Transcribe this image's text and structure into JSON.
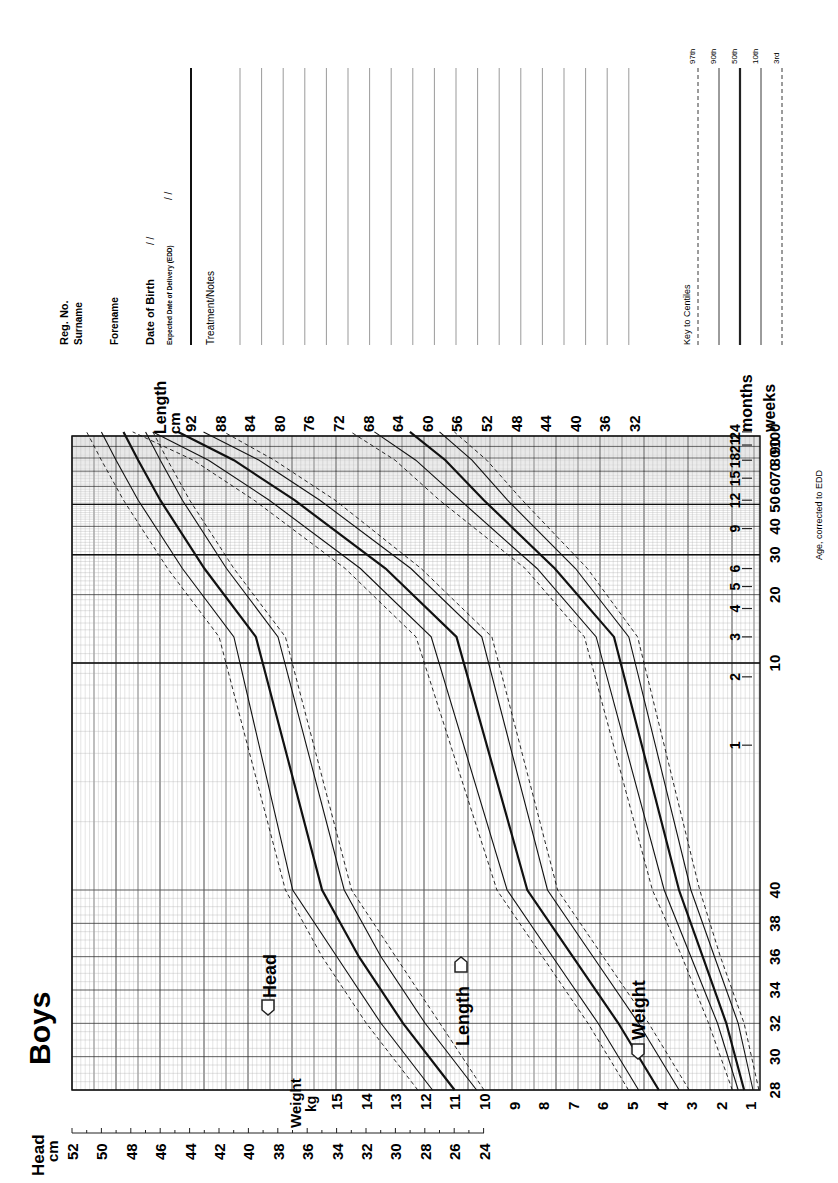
{
  "title": "Boys",
  "form": {
    "reg_no_label": "Reg. No.",
    "surname_label": "Surname",
    "forename_label": "Forename",
    "dob_label": "Date of Birth",
    "dob_value": "/ /",
    "edd_label": "Expected Date of Delivery (EDD)",
    "edd_value": "/ /",
    "notes_label": "Treatment/Notes",
    "notes_line_count": 20
  },
  "key": {
    "title": "Key to Centiles",
    "items": [
      {
        "label": "97th",
        "style": "dashed"
      },
      {
        "label": "90th",
        "style": "solid"
      },
      {
        "label": "50th",
        "style": "bold"
      },
      {
        "label": "10th",
        "style": "solid"
      },
      {
        "label": "3rd",
        "style": "dashed"
      }
    ]
  },
  "axes": {
    "head_title": "Head",
    "head_unit": "cm",
    "head_ticks": [
      52,
      50,
      48,
      46,
      44,
      42,
      40,
      38,
      36,
      34,
      32,
      30,
      28,
      26,
      24
    ],
    "weight_title": "Weight",
    "weight_unit": "kg",
    "weight_ticks": [
      15,
      14,
      13,
      12,
      11,
      10,
      9,
      8,
      7,
      6,
      5,
      4,
      3,
      2,
      1
    ],
    "length_title": "Length",
    "length_unit": "cm",
    "length_ticks": [
      92,
      88,
      84,
      80,
      76,
      72,
      68,
      64,
      60,
      56,
      52,
      48,
      44,
      40,
      36,
      32
    ],
    "weeks_title": "weeks",
    "weeks_ticks": [
      "28",
      "30",
      "32",
      "34",
      "36",
      "38",
      "40",
      "10",
      "20",
      "30",
      "40",
      "50",
      "60",
      "70",
      "80",
      "90",
      "100"
    ],
    "months_title": "months",
    "months_ticks": [
      "1",
      "2",
      "3",
      "4",
      "5",
      "6",
      "9",
      "12",
      "15",
      "18",
      "21",
      "24"
    ],
    "footnote": "Age, corrected to EDD"
  },
  "labels": {
    "head": "Head",
    "length": "Length",
    "weight": "Weight"
  },
  "chart_data": {
    "type": "line",
    "title": "Boys",
    "xlabel": "Age, corrected to EDD (weeks gestation 28-40, then weeks 0-100 / months 1-24)",
    "x_ticks": [
      "28",
      "30",
      "32",
      "34",
      "36",
      "38",
      "40",
      "1m",
      "2m",
      "3m",
      "4m",
      "5m",
      "6m",
      "9m",
      "12m",
      "15m",
      "18m",
      "21m",
      "24m"
    ],
    "x": [
      "28w",
      "32w",
      "36w",
      "40w",
      "3m",
      "6m",
      "12m",
      "18m",
      "24m"
    ],
    "grid": true,
    "legend": [
      "97th",
      "90th",
      "50th",
      "10th",
      "3rd"
    ],
    "series": [
      {
        "name": "Head 97th (cm)",
        "values": [
          28.5,
          32,
          35,
          37.5,
          42,
          45.5,
          48.5,
          50,
          51
        ]
      },
      {
        "name": "Head 90th (cm)",
        "values": [
          27.5,
          31,
          34,
          37,
          41,
          44.5,
          47.5,
          49,
          50
        ]
      },
      {
        "name": "Head 50th (cm)",
        "values": [
          26,
          29.5,
          32.5,
          35,
          39.5,
          43,
          46,
          47.5,
          48.5
        ]
      },
      {
        "name": "Head 10th (cm)",
        "values": [
          24.5,
          28,
          31,
          33.5,
          38,
          41.5,
          44.5,
          46,
          47
        ]
      },
      {
        "name": "Head 3rd (cm)",
        "values": [
          24,
          27,
          30,
          33,
          37.5,
          41,
          44,
          45.5,
          46.5
        ]
      },
      {
        "name": "Length 97th (cm)",
        "values": [
          41,
          45,
          49.5,
          54,
          62,
          69,
          78,
          84,
          90
        ]
      },
      {
        "name": "Length 90th (cm)",
        "values": [
          40,
          44,
          48.5,
          53,
          60.5,
          67.5,
          76.5,
          82.5,
          88
        ]
      },
      {
        "name": "Length 50th (cm)",
        "values": [
          38,
          42,
          46.5,
          51,
          58,
          65,
          74,
          80,
          85.5
        ]
      },
      {
        "name": "Length 10th (cm)",
        "values": [
          36,
          40,
          44.5,
          49,
          55.5,
          62.5,
          71.5,
          77.5,
          83
        ]
      },
      {
        "name": "Length 3rd (cm)",
        "values": [
          35,
          39,
          43.5,
          48,
          54.5,
          61.5,
          70,
          76,
          81
        ]
      },
      {
        "name": "Weight 97th (kg)",
        "values": [
          1.6,
          2.4,
          3.3,
          4.3,
          6.6,
          8.6,
          11.5,
          13,
          14.5
        ]
      },
      {
        "name": "Weight 90th (kg)",
        "values": [
          1.4,
          2.1,
          3.0,
          3.9,
          6.2,
          8.2,
          10.8,
          12.3,
          13.7
        ]
      },
      {
        "name": "Weight 50th (kg)",
        "values": [
          1.2,
          1.8,
          2.6,
          3.4,
          5.6,
          7.6,
          10,
          11.3,
          12.5
        ]
      },
      {
        "name": "Weight 10th (kg)",
        "values": [
          0.9,
          1.4,
          2.2,
          3.0,
          5.1,
          6.9,
          9.2,
          10.4,
          11.5
        ]
      },
      {
        "name": "Weight 3rd (kg)",
        "values": [
          0.7,
          1.2,
          2.0,
          2.7,
          4.8,
          6.5,
          8.7,
          9.9,
          11
        ]
      }
    ],
    "ylim_head": [
      24,
      52
    ],
    "ylim_length": [
      32,
      92
    ],
    "ylim_weight": [
      1,
      15
    ]
  }
}
